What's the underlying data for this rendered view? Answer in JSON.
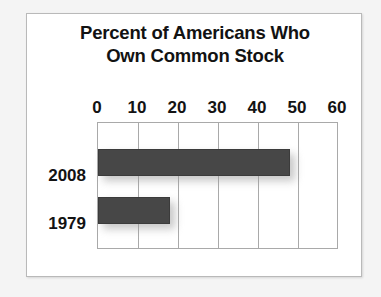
{
  "chart_data": {
    "type": "bar",
    "orientation": "horizontal",
    "title": "Percent of Americans Who Own Common Stock",
    "title_lines": [
      "Percent of Americans Who",
      "Own Common Stock"
    ],
    "categories": [
      "2008",
      "1979"
    ],
    "values": [
      48,
      18
    ],
    "xlabel": "",
    "ylabel": "",
    "xlim": [
      0,
      60
    ],
    "xticks": [
      0,
      10,
      20,
      30,
      40,
      50,
      60
    ],
    "xtick_labels": [
      "0",
      "10",
      "20",
      "30",
      "40",
      "50",
      "60"
    ],
    "grid": true,
    "grid_axis": "x",
    "legend": false,
    "bar_color": "#474747",
    "grid_color": "#a9a9a9",
    "background_color": "#ffffff",
    "text_color": "#131313"
  }
}
